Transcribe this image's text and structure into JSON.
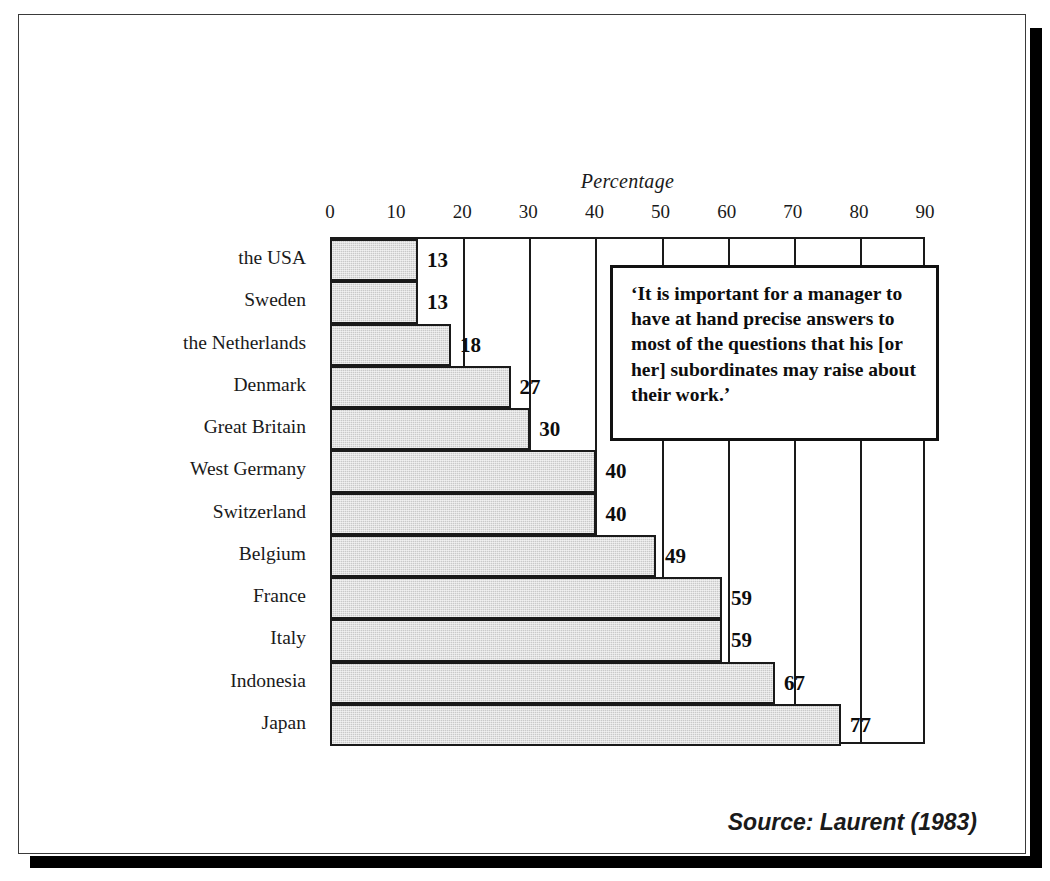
{
  "figure": {
    "source_note": "Source: Laurent (1983)",
    "frame_border_color": "#3a3a3a",
    "shadow_color": "#000000"
  },
  "callout": {
    "name": "quote-callout",
    "text": "‘It is important for a manager to have at hand precise answers to most of the questions that his [or her] subordinates may raise about their work.’"
  },
  "chart_data": {
    "type": "bar",
    "orientation": "horizontal",
    "title": "",
    "xlabel": "Percentage",
    "ylabel": "",
    "xlim": [
      0,
      90
    ],
    "xticks": [
      0,
      10,
      20,
      30,
      40,
      50,
      60,
      70,
      80,
      90
    ],
    "grid": true,
    "grid_axis": "x",
    "legend": false,
    "bar_fill_color": "#c9c9c9",
    "bar_edge_color": "#1a1a1a",
    "categories": [
      "the USA",
      "Sweden",
      "the Netherlands",
      "Denmark",
      "Great Britain",
      "West Germany",
      "Switzerland",
      "Belgium",
      "France",
      "Italy",
      "Indonesia",
      "Japan"
    ],
    "values": [
      13,
      13,
      18,
      27,
      30,
      40,
      40,
      49,
      59,
      59,
      67,
      77
    ],
    "value_labels": [
      "13",
      "13",
      "18",
      "27",
      "30",
      "40",
      "40",
      "49",
      "59",
      "59",
      "67",
      "77"
    ],
    "annotations": [
      "‘It is important for a manager to have at hand precise answers to most of the questions that his [or her] subordinates may raise about their work.’"
    ],
    "source": "Source: Laurent (1983)"
  }
}
